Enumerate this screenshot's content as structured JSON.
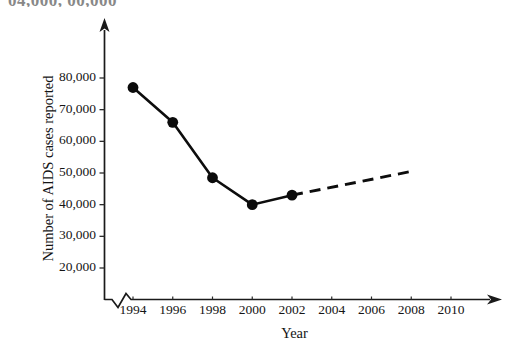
{
  "clipped_header_text": "04,000, 00,000",
  "chart_data": {
    "type": "line",
    "title": "",
    "xlabel": "Year",
    "ylabel": "Number of AIDS cases reported",
    "x": [
      1994,
      1996,
      1998,
      2000,
      2002
    ],
    "values": [
      77000,
      66000,
      48500,
      40000,
      43000
    ],
    "xticks": [
      "1994",
      "1996",
      "1998",
      "2000",
      "2002",
      "2004",
      "2006",
      "2008",
      "2010"
    ],
    "xtick_values": [
      1994,
      1996,
      1998,
      2000,
      2002,
      2004,
      2006,
      2008,
      2010
    ],
    "yticks": [
      "20,000",
      "30,000",
      "40,000",
      "50,000",
      "60,000",
      "70,000",
      "80,000"
    ],
    "ytick_values": [
      20000,
      30000,
      40000,
      50000,
      60000,
      70000,
      80000
    ],
    "xlim": [
      1994,
      2010
    ],
    "ylim": [
      15000,
      85000
    ],
    "grid": false,
    "legend": null,
    "axis_break_x": true,
    "series": [
      {
        "name": "Reported AIDS cases",
        "style": "solid",
        "marker": "filled-circle",
        "x": [
          1994,
          1996,
          1998,
          2000,
          2002
        ],
        "values": [
          77000,
          66000,
          48500,
          40000,
          43000
        ]
      },
      {
        "name": "Projected trend",
        "style": "dashed",
        "marker": "none",
        "x": [
          2002,
          2008
        ],
        "values": [
          43000,
          50500
        ]
      }
    ],
    "annotations": [
      "Solid line with filled circular markers shows reported values 1994-2002.",
      "Dashed line extrapolates from 2002 upward to about 50,500 near 2008.",
      "Zigzag break on the horizontal axis between the origin and 1994."
    ]
  },
  "colors": {
    "axis": "#1a1a1a",
    "data_line": "#0d0d0d",
    "marker": "#0b0b0b",
    "background": "#ffffff"
  }
}
